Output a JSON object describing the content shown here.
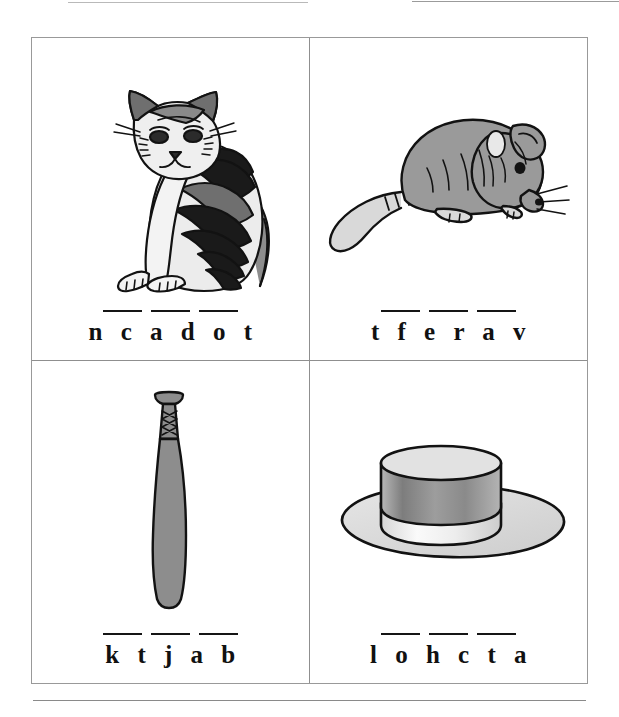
{
  "page": {
    "type": "worksheet",
    "layout": "2x2 grid of picture word-scramble items",
    "background_color": "#ffffff",
    "border_color": "#8f8f8f",
    "text_color": "#111111"
  },
  "top_rules": {
    "left_rule": "",
    "right_rule": ""
  },
  "items": [
    {
      "position": "top-left",
      "picture": "cat-illustration",
      "picture_alt": "Sitting striped tabby cat",
      "scrambled_word": "n c a d o t",
      "blank_count": 3,
      "answer_length": 6
    },
    {
      "position": "top-right",
      "picture": "rat-illustration",
      "picture_alt": "Grey rat with long tail",
      "scrambled_word": "t f e r a v",
      "blank_count": 3,
      "answer_length": 6
    },
    {
      "position": "bottom-left",
      "picture": "baseball-bat-illustration",
      "picture_alt": "Grey baseball bat with taped grip",
      "scrambled_word": "k t j a b",
      "blank_count": 3,
      "answer_length": 5
    },
    {
      "position": "bottom-right",
      "picture": "hat-illustration",
      "picture_alt": "Wide brimmed boater hat with band",
      "scrambled_word": "l o h c t a",
      "blank_count": 3,
      "answer_length": 6
    }
  ],
  "bottom_rule": ""
}
